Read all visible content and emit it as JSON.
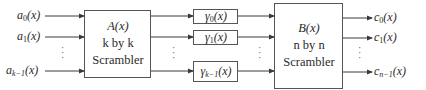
{
  "diagram": {
    "inputs": [
      {
        "base": "a",
        "sub": "0",
        "arg": "(x)"
      },
      {
        "base": "a",
        "sub": "1",
        "arg": "(x)"
      },
      {
        "base": "a",
        "sub": "k−1",
        "arg": "(x)"
      }
    ],
    "scrambler_a": {
      "line1": "A(x)",
      "line2": "k by k",
      "line3": "Scrambler"
    },
    "middle": [
      {
        "base": "γ",
        "sub": "0",
        "arg": "(x)"
      },
      {
        "base": "γ",
        "sub": "1",
        "arg": "(x)"
      },
      {
        "base": "γ",
        "sub": "k−1",
        "arg": "(x)"
      }
    ],
    "scrambler_b": {
      "line1": "B(x)",
      "line2": "n by n",
      "line3": "Scrambler"
    },
    "outputs": [
      {
        "base": "c",
        "sub": "0",
        "arg": "(x)"
      },
      {
        "base": "c",
        "sub": "1",
        "arg": "(x)"
      },
      {
        "base": "c",
        "sub": "n−1",
        "arg": "(x)"
      }
    ],
    "ellipsis": "⋮",
    "colors": {
      "line": "#3a3a3a",
      "box_border": "#555555",
      "background": "#ffffff"
    }
  }
}
